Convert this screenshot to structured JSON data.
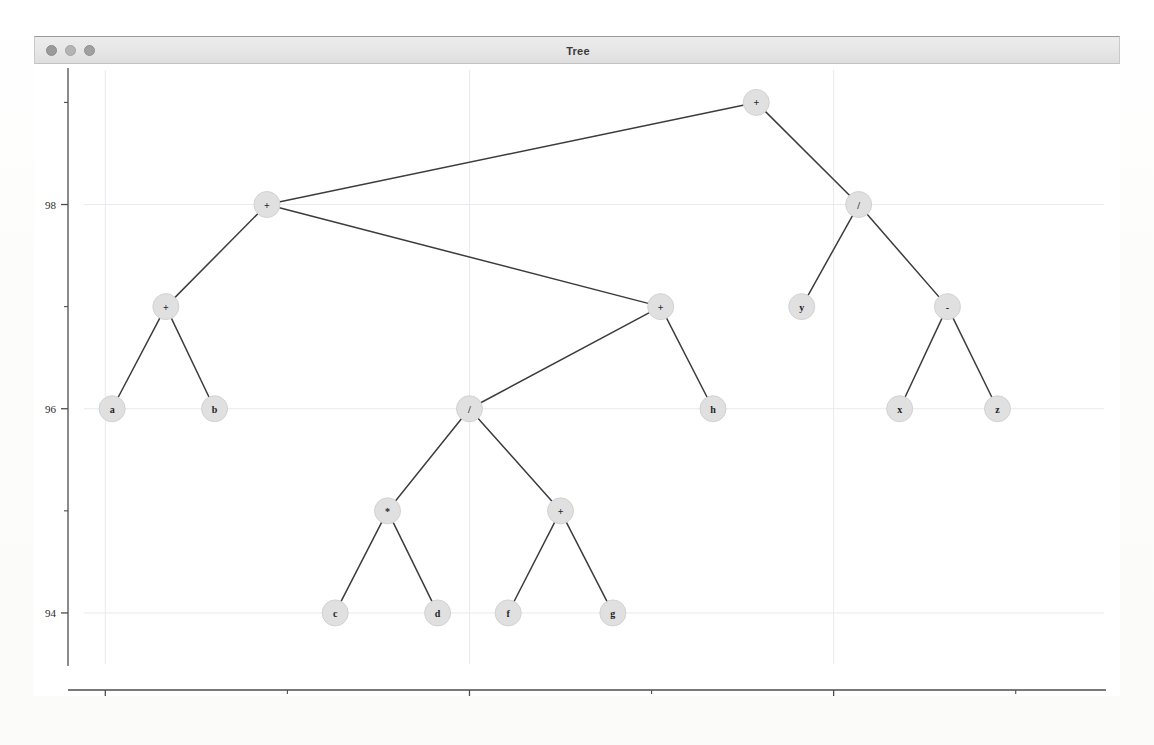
{
  "window": {
    "title": "Tree",
    "traffic_lights": [
      {
        "name": "close-button",
        "color": "#9a9a9a"
      },
      {
        "name": "minimize-button",
        "color": "#b4b4b4"
      },
      {
        "name": "zoom-button",
        "color": "#a0a0a0"
      }
    ]
  },
  "chart_data": {
    "type": "diagram",
    "title": "Tree",
    "xlabel": "",
    "ylabel": "",
    "xlim": [
      -0.6,
      21.5
    ],
    "ylim": [
      93.5,
      99.2
    ],
    "grid": true,
    "legend": null,
    "x_ticks_major": [
      0,
      8,
      16
    ],
    "x_ticks_major_labels": [
      "0",
      "8",
      "16"
    ],
    "x_ticks_minor": [
      4,
      12,
      20
    ],
    "y_ticks_major": [
      94,
      96,
      98
    ],
    "y_ticks_major_labels": [
      "94",
      "96",
      "98"
    ],
    "y_ticks_minor": [
      95,
      97,
      99
    ],
    "node_fill_color": "#e0e0e0",
    "edge_color": "#3c3c3c",
    "nodes": [
      {
        "id": "n0",
        "label": "+",
        "x": 14.3,
        "y": 99.0,
        "kind": "operator"
      },
      {
        "id": "n1",
        "label": "+",
        "x": 3.55,
        "y": 98.0,
        "kind": "operator"
      },
      {
        "id": "n2",
        "label": "/",
        "x": 16.55,
        "y": 98.0,
        "kind": "operator"
      },
      {
        "id": "n3",
        "label": "+",
        "x": 1.33,
        "y": 97.0,
        "kind": "operator"
      },
      {
        "id": "n4",
        "label": "+",
        "x": 12.2,
        "y": 97.0,
        "kind": "operator"
      },
      {
        "id": "n5",
        "label": "y",
        "x": 15.3,
        "y": 97.0,
        "kind": "variable"
      },
      {
        "id": "n6",
        "label": "-",
        "x": 18.5,
        "y": 97.0,
        "kind": "operator"
      },
      {
        "id": "n7",
        "label": "a",
        "x": 0.15,
        "y": 96.0,
        "kind": "variable"
      },
      {
        "id": "n8",
        "label": "b",
        "x": 2.4,
        "y": 96.0,
        "kind": "variable"
      },
      {
        "id": "n9",
        "label": "/",
        "x": 8.0,
        "y": 96.0,
        "kind": "operator"
      },
      {
        "id": "n10",
        "label": "h",
        "x": 13.35,
        "y": 96.0,
        "kind": "variable"
      },
      {
        "id": "n11",
        "label": "x",
        "x": 17.45,
        "y": 96.0,
        "kind": "variable"
      },
      {
        "id": "n12",
        "label": "z",
        "x": 19.6,
        "y": 96.0,
        "kind": "variable"
      },
      {
        "id": "n13",
        "label": "*",
        "x": 6.2,
        "y": 95.0,
        "kind": "operator"
      },
      {
        "id": "n14",
        "label": "+",
        "x": 10.0,
        "y": 95.0,
        "kind": "operator"
      },
      {
        "id": "n15",
        "label": "c",
        "x": 5.05,
        "y": 94.0,
        "kind": "variable"
      },
      {
        "id": "n16",
        "label": "d",
        "x": 7.3,
        "y": 94.0,
        "kind": "variable"
      },
      {
        "id": "n17",
        "label": "f",
        "x": 8.85,
        "y": 94.0,
        "kind": "variable"
      },
      {
        "id": "n18",
        "label": "g",
        "x": 11.15,
        "y": 94.0,
        "kind": "variable"
      }
    ],
    "edges": [
      {
        "from": "n0",
        "to": "n1"
      },
      {
        "from": "n0",
        "to": "n2"
      },
      {
        "from": "n1",
        "to": "n3"
      },
      {
        "from": "n1",
        "to": "n4"
      },
      {
        "from": "n2",
        "to": "n5"
      },
      {
        "from": "n2",
        "to": "n6"
      },
      {
        "from": "n3",
        "to": "n7"
      },
      {
        "from": "n3",
        "to": "n8"
      },
      {
        "from": "n4",
        "to": "n9"
      },
      {
        "from": "n4",
        "to": "n10"
      },
      {
        "from": "n6",
        "to": "n11"
      },
      {
        "from": "n6",
        "to": "n12"
      },
      {
        "from": "n9",
        "to": "n13"
      },
      {
        "from": "n9",
        "to": "n14"
      },
      {
        "from": "n13",
        "to": "n15"
      },
      {
        "from": "n13",
        "to": "n16"
      },
      {
        "from": "n14",
        "to": "n17"
      },
      {
        "from": "n14",
        "to": "n18"
      }
    ]
  }
}
